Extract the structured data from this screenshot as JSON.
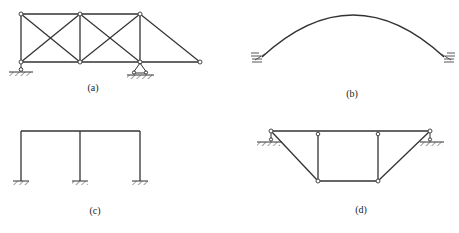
{
  "figure": {
    "panels": [
      {
        "id": "a",
        "label": "(a)",
        "type": "truss-with-cross-bracing",
        "supports": [
          "roller-left",
          "pin-middle-right"
        ]
      },
      {
        "id": "b",
        "label": "(b)",
        "type": "fixed-arch",
        "supports": [
          "fixed-left",
          "fixed-right"
        ]
      },
      {
        "id": "c",
        "label": "(c)",
        "type": "two-bay-portal-frame",
        "supports": [
          "fixed",
          "fixed",
          "fixed"
        ]
      },
      {
        "id": "d",
        "label": "(d)",
        "type": "trapezoidal-truss",
        "supports": [
          "pin-left",
          "roller-right"
        ]
      }
    ],
    "colors": {
      "line": "#333333",
      "node_fill": "#ffffff",
      "background": "#ffffff"
    }
  }
}
